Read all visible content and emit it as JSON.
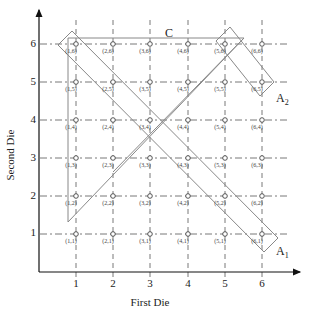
{
  "diagram": {
    "x_axis": {
      "label": "First Die",
      "ticks": [
        "1",
        "2",
        "3",
        "4",
        "5",
        "6"
      ]
    },
    "y_axis": {
      "label": "Second Die",
      "ticks": [
        "1",
        "2",
        "3",
        "4",
        "5",
        "6"
      ]
    },
    "points": [
      {
        "label": "(1,1)",
        "x": 1,
        "y": 1
      },
      {
        "label": "(2,1)",
        "x": 2,
        "y": 1
      },
      {
        "label": "(3,1)",
        "x": 3,
        "y": 1
      },
      {
        "label": "(4,1)",
        "x": 4,
        "y": 1
      },
      {
        "label": "(5,1)",
        "x": 5,
        "y": 1
      },
      {
        "label": "(6,1)",
        "x": 6,
        "y": 1
      },
      {
        "label": "(1,2)",
        "x": 1,
        "y": 2
      },
      {
        "label": "(2,2)",
        "x": 2,
        "y": 2
      },
      {
        "label": "(3,2)",
        "x": 3,
        "y": 2
      },
      {
        "label": "(4,2)",
        "x": 4,
        "y": 2
      },
      {
        "label": "(5,2)",
        "x": 5,
        "y": 2
      },
      {
        "label": "(6,2)",
        "x": 6,
        "y": 2
      },
      {
        "label": "(1,3)",
        "x": 1,
        "y": 3
      },
      {
        "label": "(2,3)",
        "x": 2,
        "y": 3
      },
      {
        "label": "(3,3)",
        "x": 3,
        "y": 3
      },
      {
        "label": "(4,3)",
        "x": 4,
        "y": 3
      },
      {
        "label": "(5,3)",
        "x": 5,
        "y": 3
      },
      {
        "label": "(6,3)",
        "x": 6,
        "y": 3
      },
      {
        "label": "(1,4)",
        "x": 1,
        "y": 4
      },
      {
        "label": "(2,4)",
        "x": 2,
        "y": 4
      },
      {
        "label": "(3,4)",
        "x": 3,
        "y": 4
      },
      {
        "label": "(4,4)",
        "x": 4,
        "y": 4
      },
      {
        "label": "(5,4)",
        "x": 5,
        "y": 4
      },
      {
        "label": "(6,4)",
        "x": 6,
        "y": 4
      },
      {
        "label": "(1,5)",
        "x": 1,
        "y": 5
      },
      {
        "label": "(2,5)",
        "x": 2,
        "y": 5
      },
      {
        "label": "(3,5)",
        "x": 3,
        "y": 5
      },
      {
        "label": "(4,5)",
        "x": 4,
        "y": 5
      },
      {
        "label": "(5,5)",
        "x": 5,
        "y": 5
      },
      {
        "label": "(6,5)",
        "x": 6,
        "y": 5
      },
      {
        "label": "(1,6)",
        "x": 1,
        "y": 6
      },
      {
        "label": "(2,6)",
        "x": 2,
        "y": 6
      },
      {
        "label": "(3,6)",
        "x": 3,
        "y": 6
      },
      {
        "label": "(4,6)",
        "x": 4,
        "y": 6
      },
      {
        "label": "(5,6)",
        "x": 5,
        "y": 6
      },
      {
        "label": "(6,6)",
        "x": 6,
        "y": 6
      }
    ],
    "regions": {
      "C": {
        "name": "C",
        "sub": "",
        "description": "Triangle: first die <= second die region bounded by top row and left column"
      },
      "A1": {
        "name": "A",
        "sub": "1",
        "description": "Diagonal band from (1,6) to (6,1)"
      },
      "A2": {
        "name": "A",
        "sub": "2",
        "description": "Band from (5,6) to (6,5)"
      }
    },
    "colors": {
      "grid": "#555555",
      "axis": "#222222",
      "region": "#888888",
      "point": "#444444"
    }
  }
}
